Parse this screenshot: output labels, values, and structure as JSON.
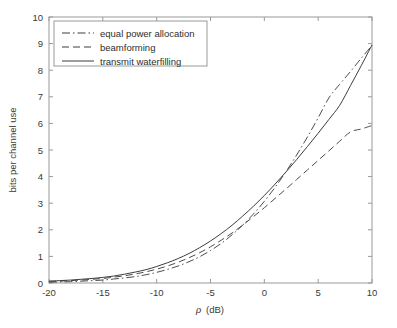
{
  "chart_data": {
    "type": "line",
    "title": "",
    "xlabel": "ρ (dB)",
    "ylabel": "bits per channel use",
    "xlim": [
      -20,
      10
    ],
    "ylim": [
      0,
      10
    ],
    "xticks": [
      -20,
      -15,
      -10,
      -5,
      0,
      5,
      10
    ],
    "xticklabels": [
      "-20",
      "-15",
      "-10",
      "-5",
      "0",
      "5",
      "10"
    ],
    "yticks": [
      0,
      1,
      2,
      3,
      4,
      5,
      6,
      7,
      8,
      9,
      10
    ],
    "yticklabels": [
      "0",
      "1",
      "2",
      "3",
      "4",
      "5",
      "6",
      "7",
      "8",
      "9",
      "10"
    ],
    "grid": false,
    "legend_position": "upper left",
    "x": [
      -20,
      -19,
      -18,
      -17,
      -16,
      -15,
      -14,
      -13,
      -12,
      -11,
      -10,
      -9,
      -8,
      -7,
      -6,
      -5,
      -4,
      -3,
      -2,
      -1,
      0,
      1,
      2,
      3,
      4,
      5,
      6,
      7,
      8,
      9,
      10
    ],
    "series": [
      {
        "name": "equal power allocation",
        "style": "dashdot",
        "color": "#4d4d4d",
        "values": [
          0.03,
          0.04,
          0.05,
          0.07,
          0.09,
          0.11,
          0.15,
          0.19,
          0.24,
          0.31,
          0.4,
          0.51,
          0.64,
          0.8,
          0.99,
          1.22,
          1.49,
          1.81,
          2.18,
          2.6,
          3.07,
          3.6,
          4.18,
          4.81,
          5.49,
          6.21,
          6.96,
          7.47,
          7.95,
          8.45,
          8.93
        ]
      },
      {
        "name": "beamforming",
        "style": "dashed",
        "color": "#4d4d4d",
        "values": [
          0.06,
          0.07,
          0.09,
          0.11,
          0.14,
          0.17,
          0.22,
          0.27,
          0.34,
          0.42,
          0.52,
          0.64,
          0.78,
          0.95,
          1.14,
          1.36,
          1.61,
          1.88,
          2.18,
          2.5,
          2.83,
          3.18,
          3.53,
          3.89,
          4.25,
          4.61,
          4.97,
          5.33,
          5.68,
          5.79,
          5.92
        ]
      },
      {
        "name": "transmit waterfilling",
        "style": "solid",
        "color": "#3d3d3d",
        "values": [
          0.07,
          0.09,
          0.11,
          0.14,
          0.17,
          0.21,
          0.26,
          0.33,
          0.41,
          0.5,
          0.62,
          0.76,
          0.92,
          1.11,
          1.33,
          1.58,
          1.86,
          2.17,
          2.52,
          2.89,
          3.29,
          3.72,
          4.17,
          4.64,
          5.13,
          5.63,
          6.15,
          6.68,
          7.42,
          8.17,
          8.95
        ]
      }
    ],
    "legend_entries": [
      {
        "label": "equal power allocation",
        "style": "dashdot"
      },
      {
        "label": "beamforming",
        "style": "dashed"
      },
      {
        "label": "transmit waterfilling",
        "style": "solid"
      }
    ]
  }
}
